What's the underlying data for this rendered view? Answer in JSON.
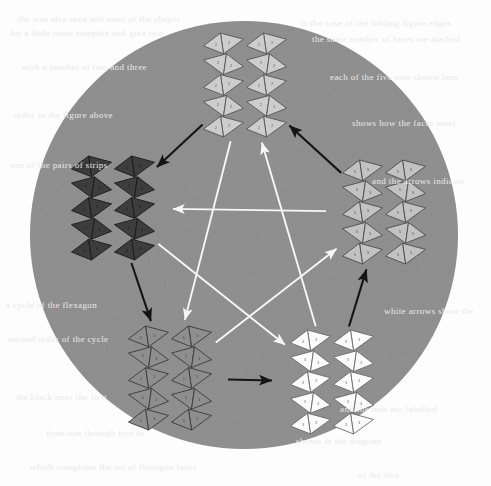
{
  "figure": {
    "width": 491,
    "height": 486,
    "background_color": "#fdfdfd",
    "disc": {
      "name": "background-disc",
      "center_x": 244,
      "center_y": 235,
      "radius": 214,
      "fill_color": "#8c8c8c"
    }
  },
  "clusters": [
    {
      "id": "top",
      "label": "top-cluster",
      "position_label": "top",
      "center_x": 245,
      "center_y": 85,
      "fill_color": "#cdcdcd",
      "stroke_color": "#555555",
      "face_label": "2",
      "strip_count": 2,
      "facets_per_strip": 10
    },
    {
      "id": "left",
      "label": "left-cluster",
      "position_label": "left",
      "center_x": 113,
      "center_y": 208,
      "fill_color": "#3d3d3d",
      "stroke_color": "#1a1a1a",
      "face_label": "4",
      "strip_count": 2,
      "facets_per_strip": 10
    },
    {
      "id": "right",
      "label": "right-cluster",
      "position_label": "right",
      "center_x": 384,
      "center_y": 212,
      "fill_color": "#c2c2c2",
      "stroke_color": "#4d4d4d",
      "face_label": "5",
      "strip_count": 2,
      "facets_per_strip": 10
    },
    {
      "id": "bottom-left",
      "label": "bottom-left-cluster",
      "position_label": "bottom-left",
      "center_x": 170,
      "center_y": 378,
      "fill_color": "#8e8e8e",
      "stroke_color": "#3a3a3a",
      "face_label": "1",
      "strip_count": 2,
      "facets_per_strip": 10
    },
    {
      "id": "bottom-right",
      "label": "bottom-right-cluster",
      "position_label": "bottom-right",
      "center_x": 332,
      "center_y": 382,
      "fill_color": "#fbfbfb",
      "stroke_color": "#6a6a6a",
      "face_label": "3",
      "strip_count": 2,
      "facets_per_strip": 10
    }
  ],
  "arrows": {
    "perimeter": {
      "name": "pentagon-perimeter-arrows",
      "color": "#151515",
      "stroke_width": 2.1,
      "head_style": "solid-filled",
      "edges": [
        {
          "from": "top",
          "to": "left",
          "name": "arrow-top-to-left"
        },
        {
          "from": "left",
          "to": "bottom-left",
          "name": "arrow-left-to-bottom-left"
        },
        {
          "from": "bottom-left",
          "to": "bottom-right",
          "name": "arrow-bottom-left-to-bottom-right"
        },
        {
          "from": "bottom-right",
          "to": "right",
          "name": "arrow-bottom-right-to-right"
        },
        {
          "from": "right",
          "to": "top",
          "name": "arrow-right-to-top"
        }
      ]
    },
    "pentagram": {
      "name": "inner-pentagram-arrows",
      "color": "#f7f7f7",
      "stroke_width": 1.9,
      "head_style": "solid-filled",
      "edges": [
        {
          "from": "right",
          "to": "left",
          "name": "arrow-right-to-left"
        },
        {
          "from": "left",
          "to": "bottom-right",
          "name": "arrow-left-to-bottom-right"
        },
        {
          "from": "bottom-right",
          "to": "top",
          "name": "arrow-bottom-right-to-top"
        },
        {
          "from": "top",
          "to": "bottom-left",
          "name": "arrow-top-to-bottom-left"
        },
        {
          "from": "bottom-left",
          "to": "right",
          "name": "arrow-bottom-left-to-right"
        }
      ]
    }
  },
  "ghost_text": {
    "name": "scanned-page-bleedthrough",
    "note": "faint illegible show-through text from reverse of scanned page",
    "color": "#e9e9e9",
    "lines": [
      {
        "text": "the was also seen and meet of the shapes",
        "x": 18,
        "y": 14,
        "rotate": 0
      },
      {
        "text": "for a little more complex and give two",
        "x": 10,
        "y": 28,
        "rotate": 0
      },
      {
        "text": "in the case of the folding figure edges",
        "x": 300,
        "y": 18,
        "rotate": 0
      },
      {
        "text": "the same number of faces are marked",
        "x": 312,
        "y": 34,
        "rotate": 0
      },
      {
        "text": "with a number of two and three",
        "x": 22,
        "y": 62,
        "rotate": 0
      },
      {
        "text": "each of the five nets shown here",
        "x": 330,
        "y": 72,
        "rotate": 0
      },
      {
        "text": "order in the figure above",
        "x": 14,
        "y": 110,
        "rotate": 0
      },
      {
        "text": "shows how the faces meet",
        "x": 352,
        "y": 118,
        "rotate": 0
      },
      {
        "text": "one of the pairs of strips",
        "x": 10,
        "y": 160,
        "rotate": 0
      },
      {
        "text": "and the arrows indicate",
        "x": 372,
        "y": 176,
        "rotate": 0
      },
      {
        "text": "a cycle of the flexagon",
        "x": 6,
        "y": 300,
        "rotate": 0
      },
      {
        "text": "white arrows show the",
        "x": 384,
        "y": 306,
        "rotate": 0
      },
      {
        "text": "second order of the cycle",
        "x": 8,
        "y": 334,
        "rotate": 0
      },
      {
        "text": "the black ones the first",
        "x": 16,
        "y": 392,
        "rotate": 0
      },
      {
        "text": "and the nets are labelled",
        "x": 340,
        "y": 404,
        "rotate": 0
      },
      {
        "text": "from one through five as",
        "x": 46,
        "y": 428,
        "rotate": 0
      },
      {
        "text": "shown in the diagram",
        "x": 296,
        "y": 436,
        "rotate": 0
      },
      {
        "text": "which completes the set of flexagon faces",
        "x": 30,
        "y": 462,
        "rotate": 0
      },
      {
        "text": "of the five",
        "x": 358,
        "y": 470,
        "rotate": 0
      }
    ]
  }
}
